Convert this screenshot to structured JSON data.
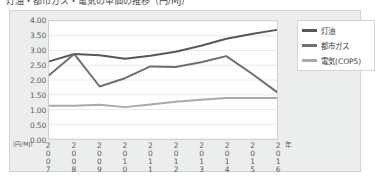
{
  "title": {
    "text": "灯油・都市ガス・電気の単価の推移（円/MJ）",
    "cropped": true
  },
  "axis": {
    "y_unit": "(円/MJ)",
    "x_unit": "年"
  },
  "legend": {
    "position": "right",
    "items": [
      {
        "label": "灯油",
        "color": "#555759"
      },
      {
        "label": "都市ガス",
        "color": "#6d6f71"
      },
      {
        "label": "電気(COP5)",
        "color": "#a7a9ab"
      }
    ]
  },
  "chart_data": {
    "type": "line",
    "title": "灯油・都市ガス・電気の単価の推移（円/MJ）",
    "xlabel": "年",
    "ylabel": "(円/MJ)",
    "ylim": [
      0.0,
      4.0
    ],
    "ytick_step": 0.5,
    "ytick_labels": [
      "0.00",
      "0.50",
      "1.00",
      "1.50",
      "2.00",
      "2.50",
      "3.00",
      "3.50",
      "4.00"
    ],
    "grid": true,
    "legend_position": "right",
    "categories": [
      "2007",
      "2008",
      "2009",
      "2010",
      "2011",
      "2012",
      "2013",
      "2014",
      "2015",
      "2016"
    ],
    "series": [
      {
        "name": "灯油",
        "color": "#555759",
        "values": [
          2.63,
          2.88,
          2.84,
          2.72,
          2.82,
          2.96,
          3.16,
          3.4,
          3.56,
          3.7
        ]
      },
      {
        "name": "都市ガス",
        "color": "#6d6f71",
        "values": [
          2.16,
          2.88,
          1.78,
          2.06,
          2.46,
          2.44,
          2.6,
          2.81,
          2.22,
          1.59
        ]
      },
      {
        "name": "電気(COP5)",
        "color": "#a7a9ab",
        "values": [
          1.13,
          1.13,
          1.16,
          1.08,
          1.17,
          1.26,
          1.33,
          1.39,
          1.39,
          1.39
        ]
      }
    ]
  }
}
